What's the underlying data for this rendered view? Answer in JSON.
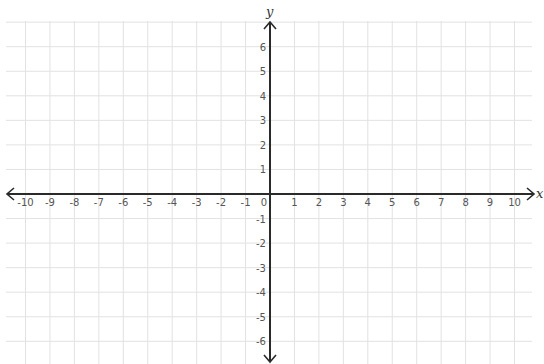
{
  "chart_data": {
    "type": "coordinate-plane",
    "title": "",
    "xlabel": "x",
    "ylabel": "y",
    "xlim": [
      -10,
      10
    ],
    "ylim": [
      -6,
      6
    ],
    "x_ticks": [
      -10,
      -9,
      -8,
      -7,
      -6,
      -5,
      -4,
      -3,
      -2,
      -1,
      0,
      1,
      2,
      3,
      4,
      5,
      6,
      7,
      8,
      9,
      10
    ],
    "y_ticks": [
      6,
      5,
      4,
      3,
      2,
      1,
      -1,
      -2,
      -3,
      -4,
      -5,
      -6
    ],
    "grid": true,
    "points": []
  },
  "colors": {
    "grid": "#e2e2e2",
    "axis": "#2a2a2a",
    "tick_text": "#555555",
    "background": "#ffffff"
  },
  "axes": {
    "x_name": "x",
    "y_name": "y"
  }
}
